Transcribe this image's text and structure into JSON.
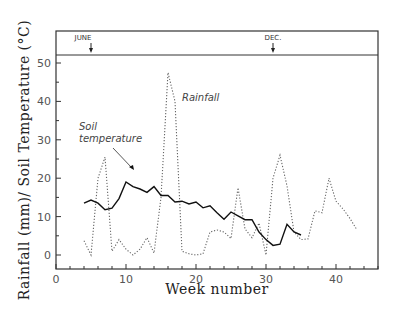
{
  "chart_data": {
    "type": "line",
    "title": "",
    "xlabel": "Week number",
    "ylabel": "Rainfall (mm)/ Soil Temperature (°C)",
    "xlim": [
      0,
      46
    ],
    "ylim": [
      -3.7,
      52
    ],
    "xticks": [
      0,
      10,
      20,
      30,
      40
    ],
    "yticks": [
      0,
      10,
      20,
      30,
      40,
      50
    ],
    "grid": false,
    "legend": "none (inline annotations)",
    "series": [
      {
        "name": "Soil temperature",
        "style": "solid",
        "x": [
          4,
          5,
          6,
          7,
          8,
          9,
          10,
          11,
          12,
          13,
          14,
          15,
          16,
          17,
          18,
          19,
          20,
          21,
          22,
          23,
          24,
          25,
          26,
          27,
          28,
          29,
          30,
          31,
          32,
          33,
          34,
          35
        ],
        "values": [
          13.5,
          14.3,
          13.5,
          11.8,
          12.2,
          14.7,
          19,
          17.8,
          17.2,
          16.3,
          17.8,
          15.5,
          15.5,
          13.8,
          14,
          13.3,
          13.8,
          12.3,
          12.8,
          11,
          9.3,
          11.2,
          10.2,
          9.2,
          9.2,
          6,
          4,
          2.5,
          2.8,
          8,
          6,
          5.2
        ]
      },
      {
        "name": "Rainfall",
        "style": "dotted",
        "x": [
          4,
          5,
          6,
          7,
          8,
          9,
          10,
          11,
          12,
          13,
          14,
          15,
          16,
          17,
          18,
          19,
          20,
          21,
          22,
          23,
          24,
          25,
          26,
          27,
          28,
          29,
          30,
          31,
          32,
          33,
          34,
          35,
          36,
          37,
          38,
          39,
          40,
          41,
          42,
          43
        ],
        "values": [
          3.7,
          0,
          20,
          25.5,
          1,
          4,
          1.5,
          0,
          1.5,
          4.5,
          0.5,
          15,
          47.5,
          40,
          1,
          0.3,
          0,
          0.3,
          6,
          6.5,
          6,
          4.3,
          17.5,
          6.8,
          4.5,
          8.3,
          0,
          20,
          26,
          18,
          6,
          4,
          4.2,
          11.5,
          11,
          20,
          14,
          12,
          9.5,
          6.5
        ]
      }
    ],
    "annotations": [
      {
        "text": "Soil",
        "x": 13.5,
        "y": 30
      },
      {
        "text": "temperature",
        "x": 13.5,
        "y": 27
      },
      {
        "text": "Rainfall",
        "x": 18,
        "y": 40
      },
      {
        "text": "JUNE",
        "x": 5,
        "y": "header"
      },
      {
        "text": "DEC.",
        "x": 31,
        "y": "header"
      }
    ]
  },
  "labels": {
    "xlabel": "Week number",
    "ylabel": "Rainfall (mm)/ Soil Temperature (°C)",
    "june": "JUNE",
    "dec": "DEC.",
    "soil_line1": "Soil",
    "soil_line2": "temperature",
    "rainfall": "Rainfall"
  }
}
